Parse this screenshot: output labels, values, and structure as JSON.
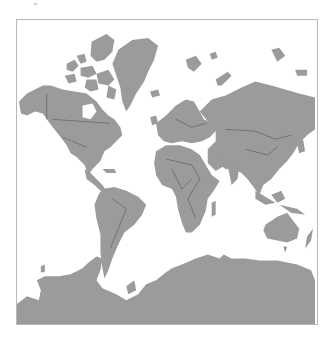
{
  "map": {
    "title": "World map (Mercator projection)",
    "projection": "mercator",
    "colors": {
      "land": "#9b9b9b",
      "borders": "#4a4a4a",
      "ocean": "#ffffff",
      "frame": "#b8b8b8"
    },
    "regions": [
      "North America",
      "Greenland",
      "South America",
      "Europe",
      "Africa",
      "Asia",
      "Australia",
      "Antarctica"
    ]
  }
}
